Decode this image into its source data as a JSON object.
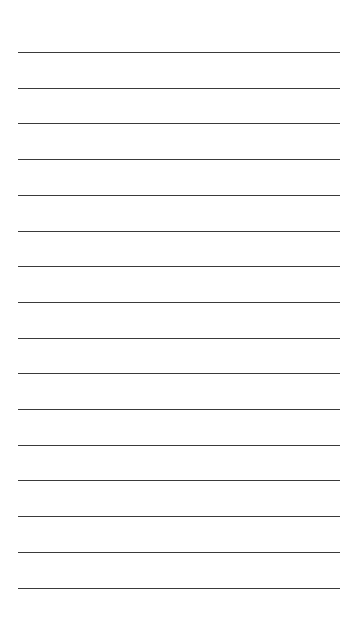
{
  "page": {
    "type": "lined-paper",
    "background": "#ffffff",
    "line_color": "#3a3a3a",
    "line_count": 16,
    "line_start_y": 52,
    "line_spacing": 35.7,
    "line_left": 18,
    "line_width": 322
  }
}
